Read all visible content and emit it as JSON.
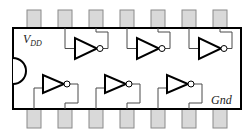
{
  "diagram": {
    "type": "14-pin DIP hex inverter pinout",
    "labels": {
      "vdd_main": "V",
      "vdd_sub": "DD",
      "gnd": "Gnd"
    },
    "pins": {
      "count": 14,
      "top_row_pin_centers_x": [
        34,
        65,
        96,
        127,
        158,
        189,
        220
      ],
      "bottom_row_pin_centers_x": [
        34,
        65,
        96,
        127,
        158,
        189,
        220
      ]
    },
    "top_inverters": [
      {
        "input_pin_index": 1,
        "output_pin_index": 2
      },
      {
        "input_pin_index": 3,
        "output_pin_index": 4
      },
      {
        "input_pin_index": 5,
        "output_pin_index": 6
      }
    ],
    "bottom_inverters": [
      {
        "input_pin_index": 0,
        "output_pin_index": 1
      },
      {
        "input_pin_index": 2,
        "output_pin_index": 3
      },
      {
        "input_pin_index": 4,
        "output_pin_index": 5
      }
    ],
    "colors": {
      "outline": "#000000",
      "pin_fill": "#d9d9d9",
      "wire": "#4a4a4a"
    }
  }
}
